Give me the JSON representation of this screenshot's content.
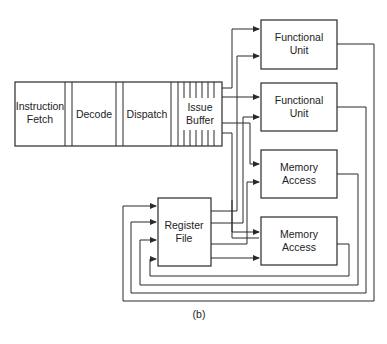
{
  "pipeline": {
    "stages": [
      {
        "line1": "Instruction",
        "line2": "Fetch"
      },
      {
        "line1": "Decode",
        "line2": ""
      },
      {
        "line1": "Dispatch",
        "line2": ""
      },
      {
        "line1": "Issue",
        "line2": "Buffer"
      }
    ]
  },
  "units": [
    {
      "line1": "Functional",
      "line2": "Unit"
    },
    {
      "line1": "Functional",
      "line2": "Unit"
    },
    {
      "line1": "Memory",
      "line2": "Access"
    },
    {
      "line1": "Memory",
      "line2": "Access"
    }
  ],
  "register_file": {
    "line1": "Register",
    "line2": "File"
  },
  "caption": "(b)",
  "colors": {
    "stroke": "#2a2a2a",
    "background": "#ffffff",
    "text": "#222222"
  }
}
